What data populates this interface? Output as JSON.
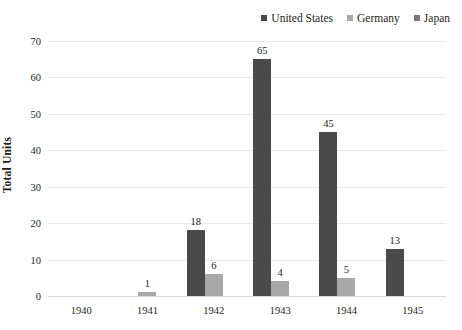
{
  "chart_data": {
    "type": "bar",
    "title": "",
    "subtitle": "",
    "xlabel": "",
    "ylabel": "Total Units",
    "categories": [
      "1940",
      "1941",
      "1942",
      "1943",
      "1944",
      "1945"
    ],
    "series": [
      {
        "name": "United States",
        "color": "#4a4a4a",
        "values": [
          null,
          null,
          18,
          65,
          45,
          13
        ]
      },
      {
        "name": "Germany",
        "color": "#a8a8a8",
        "values": [
          null,
          1,
          6,
          4,
          5,
          null
        ]
      },
      {
        "name": "Japan",
        "color": "#7a7a7a",
        "values": [
          null,
          null,
          null,
          null,
          null,
          null
        ]
      }
    ],
    "ylim": [
      0,
      70
    ],
    "yticks": [
      0,
      10,
      20,
      30,
      40,
      50,
      60,
      70
    ],
    "ytick_labels": [
      "0",
      "10",
      "20",
      "30",
      "40",
      "50",
      "60",
      "70"
    ],
    "grid": true,
    "grid_color": "#e8e8e8",
    "legend_position": "top-right",
    "data_labels": true,
    "background": "#ffffff",
    "text_color": "#231f20"
  }
}
